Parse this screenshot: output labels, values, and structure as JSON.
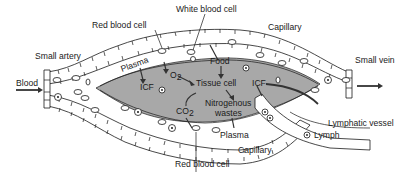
{
  "diagram": {
    "labels": {
      "white_blood_cell_top": "White blood cell",
      "red_blood_cell_top": "Red blood cell",
      "capillary_top": "Capillary",
      "small_artery": "Small artery",
      "small_vein": "Small vein",
      "blood": "Blood",
      "plasma_top": "Plasma",
      "icf_left": "ICF",
      "o2": "O",
      "o2_sub": "2",
      "food": "Food",
      "tissue_cell": "Tissue cell",
      "icf_right": "ICF",
      "co2": "CO",
      "co2_sub": "2",
      "nitrogenous_line1": "Nitrogenous",
      "nitrogenous_line2": "wastes",
      "plasma_bottom": "Plasma",
      "lymphatic_vessel": "Lymphatic vessel",
      "lymph": "Lymph",
      "capillary_bottom": "Capillary",
      "red_blood_cell_bottom": "Red blood cell"
    },
    "colors": {
      "tissue_fluid": "#a8a8a8",
      "outline": "#1a1a1a",
      "background": "#ffffff"
    }
  }
}
